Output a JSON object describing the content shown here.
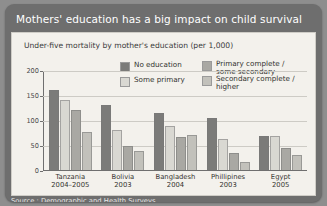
{
  "title": "Mothers' education has a big impact on child survival",
  "subtitle": "Under-five mortality by mother's education (per 1,000)",
  "source": "Source : Demographic and Health Surveys",
  "colors": {
    "panel": "#6e6e6e",
    "card": "#f3f1ec",
    "series": [
      "#7b7b79",
      "#d9d8d2",
      "#a9a8a3",
      "#c2c1bb"
    ]
  },
  "chart_data": {
    "type": "bar",
    "title": "Mothers' education has a big impact on child survival",
    "subtitle": "Under-five mortality by mother's education (per 1,000)",
    "xlabel": "",
    "ylabel": "",
    "ylim": [
      0,
      200
    ],
    "yticks": [
      0,
      50,
      100,
      150,
      200
    ],
    "grid": true,
    "legend_position": "top-right",
    "categories": [
      "Tanzania",
      "Bolivia",
      "Bangladesh",
      "Phillipines",
      "Egypt"
    ],
    "category_years": [
      "2004–2005",
      "2003",
      "2004",
      "2003",
      "2005"
    ],
    "series": [
      {
        "name": "No education",
        "values": [
          160,
          130,
          115,
          105,
          68
        ]
      },
      {
        "name": "Some primary",
        "values": [
          141,
          81,
          88,
          62,
          68
        ]
      },
      {
        "name": "Primary complete /\nsome secondary",
        "values": [
          121,
          49,
          67,
          35,
          44
        ]
      },
      {
        "name": "Secondary complete /\nhigher",
        "values": [
          77,
          38,
          71,
          17,
          30
        ]
      }
    ]
  }
}
